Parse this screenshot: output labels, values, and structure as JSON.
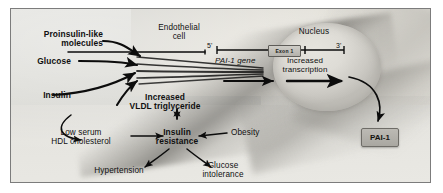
{
  "figure": {
    "title_alt": "Mechanism of increased PAI-1 expression in endothelial cells in insulin resistance",
    "border_color": "#7c7c7c",
    "background_color": "#d8d8d4",
    "text_color": "#101010"
  },
  "anatomy": {
    "endothelial_cell_label": "Endothelial\ncell",
    "nucleus_label": "Nucleus"
  },
  "gene": {
    "five_prime": "5'",
    "three_prime": "3'",
    "exon_label": "Exon 1",
    "gene_name": "PAI-1 gene",
    "transcription_label": "Increased\ntranscription"
  },
  "stimuli": [
    {
      "id": "proinsulin",
      "label": "Proinsulin-like\nmolecules",
      "bold": true
    },
    {
      "id": "glucose",
      "label": "Glucose",
      "bold": true
    },
    {
      "id": "insulin",
      "label": "Insulin",
      "bold": true
    },
    {
      "id": "vldl",
      "label": "Increased\nVLDL triglyceride",
      "bold": true
    }
  ],
  "syndrome": [
    {
      "id": "insulin-resistance",
      "label": "Insulin\nresistance",
      "bold": true
    },
    {
      "id": "obesity",
      "label": "Obesity",
      "bold": false
    },
    {
      "id": "hdl",
      "label": "Low serum\nHDL cholesterol",
      "bold": false
    },
    {
      "id": "hypertension",
      "label": "Hypertension",
      "bold": false
    },
    {
      "id": "glucose-intolerance",
      "label": "Glucose\nintolerance",
      "bold": false
    }
  ],
  "product": {
    "label": "PAI-1",
    "box_fill": "#b0aea8",
    "box_border": "#6e6c67"
  }
}
